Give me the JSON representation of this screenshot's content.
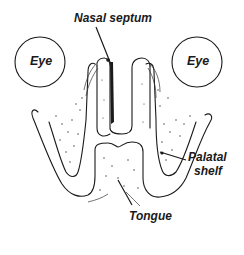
{
  "diagram": {
    "type": "anatomical cross-section (frontal section of developing palate)",
    "labels": {
      "nasal_septum": "Nasal septum",
      "eye_left": "Eye",
      "eye_right": "Eye",
      "palatal_shelf_line1": "Palatal",
      "palatal_shelf_line2": "shelf",
      "tongue": "Tongue"
    },
    "structures": [
      {
        "name": "Eye",
        "shape": "circle",
        "side": "left"
      },
      {
        "name": "Eye",
        "shape": "circle",
        "side": "right"
      },
      {
        "name": "Nasal septum",
        "shape": "midline vertical column"
      },
      {
        "name": "Palatal shelf",
        "shape": "curved shelf",
        "side": "both, label on right"
      },
      {
        "name": "Tongue",
        "shape": "rounded mass between shelves"
      }
    ],
    "colors": {
      "line": "#1a1a1a",
      "background": "#ffffff"
    }
  }
}
